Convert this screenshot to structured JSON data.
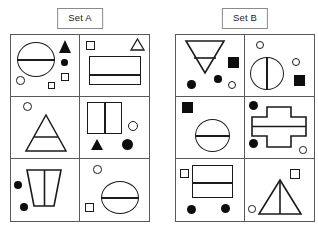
{
  "page": {
    "background": "#ffffff",
    "ink": "#1b1b1b",
    "fill": "#0d0d0d",
    "width": 318,
    "height": 236
  },
  "sets": [
    {
      "id": "set-a",
      "label": "Set A",
      "cells": [
        {
          "position": "row1-col1",
          "shapes": [
            "large-circle-with-horizontal-line",
            "small-filled-triangle",
            "small-filled-circle",
            "small-open-circle",
            "small-open-square",
            "small-open-square"
          ]
        },
        {
          "position": "row1-col2",
          "shapes": [
            "small-open-square",
            "small-open-triangle",
            "large-rectangle-with-horizontal-line"
          ]
        },
        {
          "position": "row2-col1",
          "shapes": [
            "small-open-circle",
            "large-triangle-with-horizontal-line"
          ]
        },
        {
          "position": "row2-col2",
          "shapes": [
            "large-rectangle-with-vertical-line",
            "small-open-circle",
            "small-filled-triangle",
            "large-filled-circle"
          ]
        },
        {
          "position": "row3-col1",
          "shapes": [
            "large-trapezoid-with-vertical-line",
            "small-filled-circle",
            "small-filled-circle"
          ]
        },
        {
          "position": "row3-col2",
          "shapes": [
            "small-open-circle",
            "small-open-square",
            "large-circle-with-horizontal-line"
          ]
        }
      ]
    },
    {
      "id": "set-b",
      "label": "Set B",
      "cells": [
        {
          "position": "row1-col1",
          "shapes": [
            "large-inverted-triangle-with-horizontal-line",
            "small-filled-square",
            "small-filled-circle",
            "small-filled-circle",
            "small-open-circle"
          ]
        },
        {
          "position": "row1-col2",
          "shapes": [
            "small-open-circle",
            "large-ellipse-with-vertical-line",
            "small-open-circle",
            "small-filled-square"
          ]
        },
        {
          "position": "row2-col1",
          "shapes": [
            "small-filled-square",
            "large-circle-with-horizontal-line"
          ]
        },
        {
          "position": "row2-col2",
          "shapes": [
            "small-filled-circle",
            "large-cross-with-horizontal-line",
            "small-filled-circle",
            "small-open-circle"
          ]
        },
        {
          "position": "row3-col1",
          "shapes": [
            "small-open-square",
            "large-rectangle-with-horizontal-line",
            "small-filled-circle",
            "small-filled-circle"
          ]
        },
        {
          "position": "row3-col2",
          "shapes": [
            "small-open-square",
            "large-triangle-with-vertical-line",
            "small-open-circle"
          ]
        }
      ]
    }
  ]
}
